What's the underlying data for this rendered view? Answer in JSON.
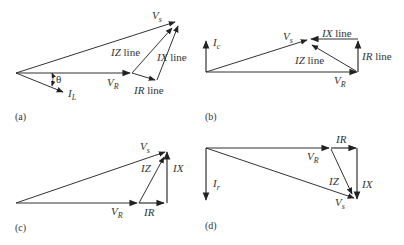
{
  "panels": [
    {
      "id": "a",
      "caption": "(a)",
      "labels": {
        "vs": {
          "main": "V",
          "sub": "s"
        },
        "vr": {
          "main": "V",
          "sub": "R"
        },
        "il": {
          "main": "I",
          "sub": "L"
        },
        "theta": "θ",
        "iz": {
          "italic": "IZ",
          "rest": " line"
        },
        "ix": {
          "italic": "IX",
          "rest": " line"
        },
        "ir": {
          "italic": "IR",
          "rest": " line"
        }
      }
    },
    {
      "id": "b",
      "caption": "(b)",
      "labels": {
        "vs": {
          "main": "V",
          "sub": "s"
        },
        "vr": {
          "main": "V",
          "sub": "R"
        },
        "ic": {
          "main": "I",
          "sub": "c"
        },
        "iz": {
          "italic": "IZ",
          "rest": " line"
        },
        "ix": {
          "italic": "IX",
          "rest": " line"
        },
        "ir": {
          "italic": "IR",
          "rest": " line"
        }
      }
    },
    {
      "id": "c",
      "caption": "(c)",
      "labels": {
        "vs": {
          "main": "V",
          "sub": "s"
        },
        "vr": {
          "main": "V",
          "sub": "R"
        },
        "iz": "IZ",
        "ix": "IX",
        "ir": "IR"
      }
    },
    {
      "id": "d",
      "caption": "(d)",
      "labels": {
        "vs": {
          "main": "V",
          "sub": "s"
        },
        "vr": {
          "main": "V",
          "sub": "R"
        },
        "ir_current": {
          "main": "I",
          "sub": "r"
        },
        "iz": "IZ",
        "ix": "IX",
        "ir": "IR"
      }
    }
  ]
}
